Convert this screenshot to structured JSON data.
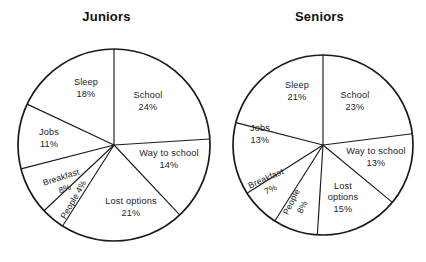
{
  "figure": {
    "background_color": "#ffffff",
    "line_color": "#1b1b1b",
    "text_color": "#232323"
  },
  "chart_data": [
    {
      "type": "pie",
      "title": "Juniors",
      "xlabel": "",
      "ylabel": "",
      "legend": "none",
      "grid": false,
      "start_angle_deg": 0,
      "direction": "clockwise",
      "center": {
        "x": 114,
        "y": 145
      },
      "radius": 96,
      "categories": [
        "School",
        "Way to school",
        "Lost options",
        "People",
        "Breakfast",
        "Jobs",
        "Sleep"
      ],
      "values": [
        24,
        14,
        21,
        4,
        8,
        11,
        18
      ],
      "slices": [
        {
          "name": "School",
          "value": 24,
          "label": "School",
          "value_label": "24%",
          "style": "upright",
          "label_x": 148,
          "label_y": 98,
          "label_r": 0
        },
        {
          "name": "Way to school",
          "value": 14,
          "label": "Way to school",
          "value_label": "14%",
          "style": "upright",
          "label_x": 169,
          "label_y": 156,
          "label_r": 0
        },
        {
          "name": "Lost options",
          "value": 21,
          "label": "Lost options",
          "value_label": "21%",
          "style": "upright",
          "label_x": 131,
          "label_y": 204,
          "label_r": 0
        },
        {
          "name": "People",
          "value": 4,
          "label": "People 4%",
          "value_label": "",
          "style": "rotated",
          "label_x": 76,
          "label_y": 201,
          "label_r": -60
        },
        {
          "name": "Breakfast",
          "value": 8,
          "label": "Breakfast",
          "value_label": "8%",
          "style": "rotated",
          "label_x": 62,
          "label_y": 180,
          "label_r": -18
        },
        {
          "name": "Jobs",
          "value": 11,
          "label": "Jobs",
          "value_label": "11%",
          "style": "upright",
          "label_x": 49,
          "label_y": 135,
          "label_r": 0
        },
        {
          "name": "Sleep",
          "value": 18,
          "label": "Sleep",
          "value_label": "18%",
          "style": "upright",
          "label_x": 86,
          "label_y": 85,
          "label_r": 0
        }
      ]
    },
    {
      "type": "pie",
      "title": "Seniors",
      "xlabel": "",
      "ylabel": "",
      "legend": "none",
      "grid": false,
      "start_angle_deg": 0,
      "direction": "clockwise",
      "center": {
        "x": 110,
        "y": 145
      },
      "radius": 90,
      "categories": [
        "School",
        "Way to school",
        "Lost options",
        "People",
        "Breakfast",
        "Jobs",
        "Sleep"
      ],
      "values": [
        23,
        13,
        15,
        8,
        7,
        13,
        21
      ],
      "slices": [
        {
          "name": "School",
          "value": 23,
          "label": "School",
          "value_label": "23%",
          "style": "upright",
          "label_x": 142,
          "label_y": 98,
          "label_r": 0
        },
        {
          "name": "Way to school",
          "value": 13,
          "label": "Way to school",
          "value_label": "13%",
          "style": "upright",
          "label_x": 163,
          "label_y": 154,
          "label_r": 0
        },
        {
          "name": "Lost options",
          "value": 15,
          "label": "Lost|options",
          "value_label": "15%",
          "style": "upright-two-line",
          "label_x": 130,
          "label_y": 189,
          "label_r": 0
        },
        {
          "name": "People",
          "value": 8,
          "label": "People",
          "value_label": "8%",
          "style": "rotated",
          "label_x": 81,
          "label_y": 203,
          "label_r": -64
        },
        {
          "name": "Breakfast",
          "value": 7,
          "label": "Breakfast",
          "value_label": "7%",
          "style": "rotated",
          "label_x": 54,
          "label_y": 181,
          "label_r": -24
        },
        {
          "name": "Jobs",
          "value": 13,
          "label": "Jobs",
          "value_label": "13%",
          "style": "upright",
          "label_x": 47,
          "label_y": 131,
          "label_r": 0
        },
        {
          "name": "Sleep",
          "value": 21,
          "label": "Sleep",
          "value_label": "21%",
          "style": "upright",
          "label_x": 84,
          "label_y": 88,
          "label_r": 0
        }
      ]
    }
  ]
}
